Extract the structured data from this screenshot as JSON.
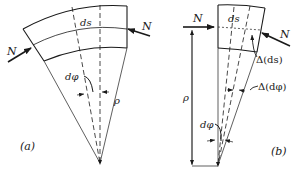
{
  "figure": {
    "panel_a": {
      "caption": "(a)",
      "labels": {
        "force_left": "N",
        "force_right": "N",
        "arc_length": "ds",
        "angle": "dφ",
        "radius": "ρ"
      }
    },
    "panel_b": {
      "caption": "(b)",
      "labels": {
        "force_left": "N",
        "force_right": "N",
        "arc_length": "ds",
        "delta_arc_length": "Δ(ds)",
        "delta_angle": "Δ(dφ)",
        "angle": "dφ",
        "radius": "ρ"
      }
    },
    "colors": {
      "ink": "#1a1a1a",
      "background": "#ffffff"
    }
  }
}
